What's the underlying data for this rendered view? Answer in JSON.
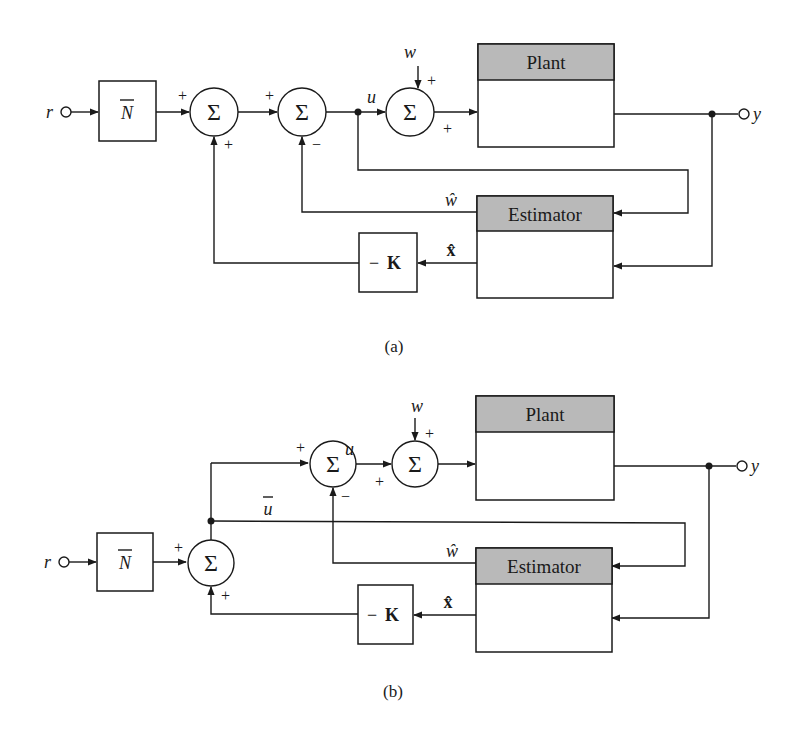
{
  "figure": {
    "colors": {
      "line": "#1a1a1a",
      "block_header": "#b9b9b9",
      "background": "#ffffff"
    }
  },
  "diagram_a": {
    "caption": "(a)",
    "input_label": "r",
    "output_label": "y",
    "gain_block": {
      "symbol": "N",
      "overbar": true
    },
    "sum1": {
      "symbol": "Σ",
      "sign_left": "+",
      "sign_bottom": "+"
    },
    "sum2": {
      "symbol": "Σ",
      "sign_left": "+",
      "sign_bottom": "−"
    },
    "control_label": "u",
    "disturbance_label": "w",
    "sum3": {
      "symbol": "Σ",
      "sign_top": "+",
      "sign_left": "+"
    },
    "plant": {
      "title": "Plant"
    },
    "estimator": {
      "title": "Estimator"
    },
    "disturbance_estimate_label": "ŵ",
    "state_estimate_label": "x̂",
    "feedback_gain": {
      "sign": "−",
      "symbol": "K"
    }
  },
  "diagram_b": {
    "caption": "(b)",
    "input_label": "r",
    "output_label": "y",
    "gain_block": {
      "symbol": "N",
      "overbar": true
    },
    "sum1": {
      "symbol": "Σ",
      "sign_left": "+",
      "sign_bottom": "+"
    },
    "ubar_label": "u",
    "sum2": {
      "symbol": "Σ",
      "sign_left": "+",
      "sign_bottom": "−"
    },
    "control_label": "u",
    "disturbance_label": "w",
    "sum3": {
      "symbol": "Σ",
      "sign_top": "+",
      "sign_left": "+"
    },
    "plant": {
      "title": "Plant"
    },
    "estimator": {
      "title": "Estimator"
    },
    "disturbance_estimate_label": "ŵ",
    "state_estimate_label": "x̂",
    "feedback_gain": {
      "sign": "−",
      "symbol": "K"
    }
  }
}
